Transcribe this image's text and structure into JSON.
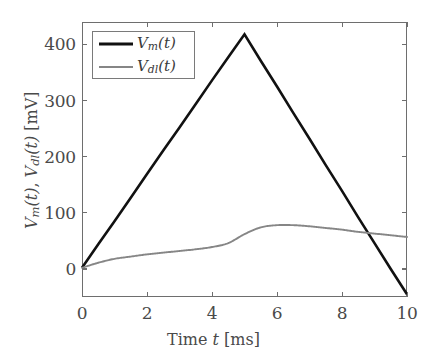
{
  "chart_data": {
    "type": "line",
    "title": "",
    "xlabel": "Time t [ms]",
    "ylabel": "V_m(t), V_dl(t) [mV]",
    "xlim": [
      0,
      10
    ],
    "ylim": [
      -50,
      440
    ],
    "grid": false,
    "legend_position": "top-left",
    "xticks": [
      0,
      2,
      4,
      6,
      8,
      10
    ],
    "xticklabels": [
      "0",
      "2",
      "4",
      "6",
      "8",
      "10"
    ],
    "yticks": [
      0,
      100,
      200,
      300,
      400
    ],
    "yticklabels": [
      "0",
      "100",
      "200",
      "300",
      "400"
    ],
    "series": [
      {
        "name": "V_m(t)",
        "color": "#111111",
        "width": 2.6,
        "x": [
          0,
          0.5,
          1,
          1.5,
          2,
          2.5,
          3,
          3.5,
          4,
          4.5,
          5,
          5.5,
          6,
          6.5,
          7,
          7.5,
          8,
          8.5,
          9,
          9.5,
          10
        ],
        "y": [
          2,
          44,
          85,
          127,
          169,
          211,
          252,
          294,
          336,
          377,
          418,
          371,
          325,
          278,
          232,
          185,
          139,
          92,
          46,
          0,
          -45
        ]
      },
      {
        "name": "V_dl(t)",
        "color": "#868686",
        "width": 1.9,
        "x": [
          0,
          0.5,
          1,
          1.5,
          2,
          2.5,
          3,
          3.5,
          4,
          4.5,
          5,
          5.5,
          6,
          6.5,
          7,
          7.5,
          8,
          8.5,
          9,
          9.5,
          10
        ],
        "y": [
          2,
          11,
          18,
          22,
          26,
          29,
          32,
          35,
          39,
          46,
          62,
          74,
          78,
          78,
          76,
          73,
          70,
          66,
          63,
          60,
          57
        ]
      }
    ]
  },
  "axis_labels": {
    "x_main": "Time",
    "x_var": "t",
    "x_unit": "[ms]",
    "y_var1": "V",
    "y_sub1": "m",
    "y_var2": "V",
    "y_sub2": "dl",
    "y_arg": "(t)",
    "y_unit": "[mV]",
    "y_sep": ", "
  },
  "legend": {
    "entries": [
      {
        "label_var": "V",
        "label_sub": "m",
        "label_arg": "(t)",
        "color": "#111111"
      },
      {
        "label_var": "V",
        "label_sub": "dl",
        "label_arg": "(t)",
        "color": "#868686"
      }
    ]
  },
  "colors": {
    "vm": "#111111",
    "vdl": "#868686",
    "axis": "#6e6e6e",
    "text": "#4a4a4a",
    "background": "#ffffff"
  }
}
